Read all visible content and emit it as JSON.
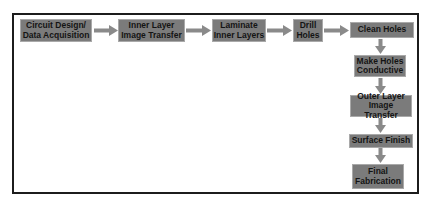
{
  "diagram": {
    "type": "process-flowchart",
    "colors": {
      "box_fill": "#7b7b7b",
      "box_text": "#141414",
      "arrow": "#8a8a8a",
      "frame": "#1c1c1c"
    },
    "steps": [
      {
        "label": "Circuit Design/\nData Acquisition"
      },
      {
        "label": "Inner Layer\nImage Transfer"
      },
      {
        "label": "Laminate\nInner Layers"
      },
      {
        "label": "Drill\nHoles"
      },
      {
        "label": "Clean Holes"
      },
      {
        "label": "Make Holes\nConductive"
      },
      {
        "label": "Outer Layer\nImage Transfer"
      },
      {
        "label": "Surface Finish"
      },
      {
        "label": "Final\nFabrication"
      }
    ],
    "edges": [
      {
        "from": 0,
        "to": 1
      },
      {
        "from": 1,
        "to": 2
      },
      {
        "from": 2,
        "to": 3
      },
      {
        "from": 3,
        "to": 4
      },
      {
        "from": 4,
        "to": 5
      },
      {
        "from": 5,
        "to": 6
      },
      {
        "from": 6,
        "to": 7
      },
      {
        "from": 7,
        "to": 8
      }
    ]
  }
}
